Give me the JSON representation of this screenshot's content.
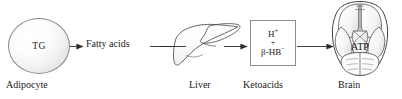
{
  "diagram": {
    "background_color": "#ffffff",
    "stroke_color": "#4a4a4a",
    "text_color": "#1a1a1a"
  },
  "nodes": {
    "adipocyte": {
      "inner_label": "TG",
      "caption": "Adipocyte",
      "shape": "circle-cell",
      "fill": "#f4f4f4",
      "border_color": "#8a8a8a"
    },
    "fatty_acids": {
      "label": "Fatty acids"
    },
    "liver": {
      "caption": "Liver",
      "shape": "liver-organ-outline",
      "border_color": "#4a4a4a"
    },
    "ketoacids": {
      "caption": "Ketoacids",
      "shape": "box",
      "border_color": "#8c8c8c",
      "formula_lines": [
        {
          "species": "H",
          "charge": "+"
        },
        {
          "species": "+",
          "charge": ""
        },
        {
          "species": "β-HB",
          "charge": "−"
        }
      ],
      "line1": "H+",
      "line2": "+",
      "line3": "β-HB−"
    },
    "brain": {
      "caption": "Brain",
      "inner_label": "ATP",
      "shape": "brain-inferior-view",
      "border_color": "#3a3a3a"
    }
  },
  "arrows": [
    {
      "name": "adipocyte-to-fatty-acids",
      "from": "adipocyte",
      "to": "fatty_acids"
    },
    {
      "name": "fatty-acids-to-liver",
      "from": "fatty_acids",
      "to": "liver"
    },
    {
      "name": "liver-to-ketoacids",
      "from": "liver",
      "to": "ketoacids"
    },
    {
      "name": "ketoacids-to-brain",
      "from": "ketoacids",
      "to": "brain"
    }
  ]
}
